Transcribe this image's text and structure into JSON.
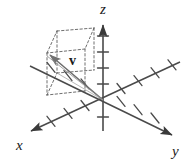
{
  "figure": {
    "background_color": "#ffffff",
    "axis_color": "#4a4a4a",
    "dash_color": "#555555",
    "vector_color": "#6b6b6b",
    "label_color": "#1a1a1a",
    "labels": {
      "x_axis": "x",
      "y_axis": "y",
      "z_axis": "z",
      "vector": "v"
    },
    "geometry": {
      "origin": {
        "x": 103,
        "y": 100
      },
      "z_axis_tip": {
        "x": 103,
        "y": 22
      },
      "z_axis_tail": {
        "x": 103,
        "y": 131
      },
      "x_axis_tip": {
        "x": 27,
        "y": 133
      },
      "x_axis_tail": {
        "x": 180,
        "y": 62
      },
      "y_axis_tip": {
        "x": 176,
        "y": 137
      },
      "y_axis_tail": {
        "x": 30,
        "y": 66
      },
      "vector_tip": {
        "x": 47,
        "y": 53
      },
      "box_top_near_left": {
        "x": 47,
        "y": 53
      },
      "box_top_far_left": {
        "x": 57,
        "y": 31
      },
      "box_top_far_right": {
        "x": 94,
        "y": 28
      },
      "box_top_near_right": {
        "x": 85,
        "y": 49
      },
      "box_bottom_near_left": {
        "x": 47,
        "y": 95
      },
      "box_bottom_far_left": {
        "x": 57,
        "y": 73
      },
      "box_bottom_far_right": {
        "x": 94,
        "y": 70
      },
      "box_bottom_near_right": {
        "x": 85,
        "y": 91
      }
    },
    "tick_counts": {
      "z_positive": 4,
      "x_positive": 4,
      "x_negative": 4,
      "y_positive": 4,
      "y_negative": 3
    },
    "label_positions": {
      "x": {
        "x": 16,
        "y": 150
      },
      "y": {
        "x": 172,
        "y": 156
      },
      "z": {
        "x": 100,
        "y": 14
      },
      "v": {
        "x": 69,
        "y": 65
      }
    }
  }
}
